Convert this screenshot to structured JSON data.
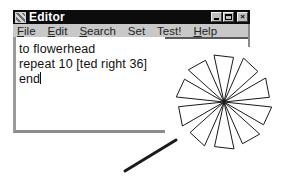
{
  "window": {
    "title": "Editor",
    "icon": "editor-app-icon",
    "controls": [
      {
        "name": "minimize",
        "icon": "minimize-icon"
      },
      {
        "name": "maximize",
        "icon": "maximize-icon"
      },
      {
        "name": "close",
        "icon": "close-icon",
        "glyph": "×"
      }
    ]
  },
  "menu": {
    "items": [
      {
        "label": "File",
        "accel": "F",
        "rest": "ile"
      },
      {
        "label": "Edit",
        "accel": "E",
        "rest": "dit"
      },
      {
        "label": "Search",
        "accel": "S",
        "rest": "earch"
      },
      {
        "label": "Set",
        "accel": "",
        "rest": "Set"
      },
      {
        "label": "Test!",
        "accel": "",
        "rest": "Test!"
      },
      {
        "label": "Help",
        "accel": "H",
        "rest": "elp"
      }
    ]
  },
  "editor": {
    "lines": [
      "to flowerhead",
      "repeat 10 [ted right 36]",
      "end"
    ]
  },
  "drawing": {
    "shape": "flowerhead",
    "petals": 10,
    "rotation_step_deg": 36,
    "center": [
      224,
      102
    ],
    "color": "#1a1a1a",
    "pointer_line": {
      "from": [
        176,
        140
      ],
      "to": [
        125,
        171
      ]
    }
  },
  "colors": {
    "titlebar": "#0c0c0c",
    "menubar": "#c8c8c8",
    "editor_bg": "#ffffff",
    "ink": "#1a1a1a"
  }
}
